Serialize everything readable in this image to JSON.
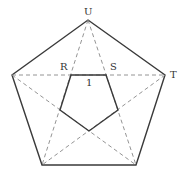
{
  "diagram": {
    "type": "pentagon-with-inscribed-star",
    "labels": {
      "U": "U",
      "T": "T",
      "R": "R",
      "S": "S",
      "segment": "1"
    },
    "outer_pentagon": [
      [
        88,
        20
      ],
      [
        165,
        75
      ],
      [
        136,
        165
      ],
      [
        42,
        165
      ],
      [
        12,
        75
      ]
    ],
    "inner_pentagon": [
      [
        71,
        75
      ],
      [
        106,
        75
      ],
      [
        118,
        110
      ],
      [
        89,
        131
      ],
      [
        60,
        110
      ]
    ],
    "colors": {
      "solid": "#3a3a3a",
      "dashed": "#888888"
    }
  }
}
